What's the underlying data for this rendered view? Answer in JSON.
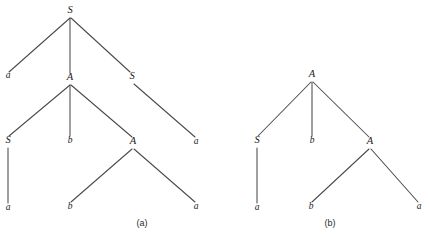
{
  "figure": {
    "background_color": "#ffffff",
    "edge_color": "#4a4a4a",
    "label_color": "#1a1a1a",
    "caption_color": "#2b2b2b",
    "width": 429,
    "height": 238
  },
  "trees": [
    {
      "id": "tree-a",
      "caption": "(a)",
      "caption_x": 142,
      "caption_y": 226,
      "root_symbol": "S",
      "nodes": [
        {
          "id": "a-root",
          "label": "S",
          "x": 70,
          "y": 13,
          "type": "nonterminal"
        },
        {
          "id": "a-n1",
          "label": "a",
          "x": 8,
          "y": 78,
          "type": "terminal"
        },
        {
          "id": "a-n2",
          "label": "A",
          "x": 70,
          "y": 80,
          "type": "nonterminal"
        },
        {
          "id": "a-n3",
          "label": "S",
          "x": 132,
          "y": 79,
          "type": "nonterminal"
        },
        {
          "id": "a-n4",
          "label": "S",
          "x": 8,
          "y": 143,
          "type": "nonterminal"
        },
        {
          "id": "a-n5",
          "label": "b",
          "x": 70,
          "y": 143,
          "type": "terminal"
        },
        {
          "id": "a-n6",
          "label": "A",
          "x": 133,
          "y": 144,
          "type": "nonterminal"
        },
        {
          "id": "a-n7",
          "label": "a",
          "x": 196,
          "y": 144,
          "type": "terminal"
        },
        {
          "id": "a-n8",
          "label": "a",
          "x": 8,
          "y": 210,
          "type": "terminal"
        },
        {
          "id": "a-n9",
          "label": "b",
          "x": 70,
          "y": 209,
          "type": "terminal"
        },
        {
          "id": "a-n10",
          "label": "a",
          "x": 196,
          "y": 209,
          "type": "terminal"
        }
      ],
      "edges": [
        {
          "from": "a-root",
          "to": "a-n1",
          "x1": 70,
          "y1": 18,
          "x2": 9,
          "y2": 72
        },
        {
          "from": "a-root",
          "to": "a-n2",
          "x1": 70,
          "y1": 18,
          "x2": 70,
          "y2": 73
        },
        {
          "from": "a-root",
          "to": "a-n3",
          "x1": 71,
          "y1": 18,
          "x2": 130,
          "y2": 72
        },
        {
          "from": "a-n2",
          "to": "a-n4",
          "x1": 70,
          "y1": 85,
          "x2": 9,
          "y2": 136
        },
        {
          "from": "a-n2",
          "to": "a-n5",
          "x1": 70,
          "y1": 85,
          "x2": 70,
          "y2": 136
        },
        {
          "from": "a-n2",
          "to": "a-n6",
          "x1": 71,
          "y1": 85,
          "x2": 132,
          "y2": 137
        },
        {
          "from": "a-n3",
          "to": "a-n7",
          "x1": 134,
          "y1": 84,
          "x2": 195,
          "y2": 137
        },
        {
          "from": "a-n4",
          "to": "a-n8",
          "x1": 8,
          "y1": 148,
          "x2": 8,
          "y2": 203
        },
        {
          "from": "a-n6",
          "to": "a-n9",
          "x1": 132,
          "y1": 149,
          "x2": 71,
          "y2": 202
        },
        {
          "from": "a-n6",
          "to": "a-n10",
          "x1": 134,
          "y1": 149,
          "x2": 195,
          "y2": 202
        }
      ]
    },
    {
      "id": "tree-b",
      "caption": "(b)",
      "caption_x": 330,
      "caption_y": 226,
      "root_symbol": "A",
      "nodes": [
        {
          "id": "b-root",
          "label": "A",
          "x": 312,
          "y": 77,
          "type": "nonterminal"
        },
        {
          "id": "b-n1",
          "label": "S",
          "x": 257,
          "y": 143,
          "type": "nonterminal"
        },
        {
          "id": "b-n2",
          "label": "b",
          "x": 312,
          "y": 143,
          "type": "terminal"
        },
        {
          "id": "b-n3",
          "label": "A",
          "x": 370,
          "y": 144,
          "type": "nonterminal"
        },
        {
          "id": "b-n4",
          "label": "a",
          "x": 257,
          "y": 210,
          "type": "terminal"
        },
        {
          "id": "b-n5",
          "label": "b",
          "x": 311,
          "y": 209,
          "type": "terminal"
        },
        {
          "id": "b-n6",
          "label": "a",
          "x": 419,
          "y": 209,
          "type": "terminal"
        }
      ],
      "edges": [
        {
          "from": "b-root",
          "to": "b-n1",
          "x1": 311,
          "y1": 82,
          "x2": 258,
          "y2": 136
        },
        {
          "from": "b-root",
          "to": "b-n2",
          "x1": 312,
          "y1": 82,
          "x2": 312,
          "y2": 136
        },
        {
          "from": "b-root",
          "to": "b-n3",
          "x1": 313,
          "y1": 82,
          "x2": 369,
          "y2": 137
        },
        {
          "from": "b-n1",
          "to": "b-n4",
          "x1": 257,
          "y1": 148,
          "x2": 257,
          "y2": 203
        },
        {
          "from": "b-n3",
          "to": "b-n5",
          "x1": 369,
          "y1": 149,
          "x2": 312,
          "y2": 202
        },
        {
          "from": "b-n3",
          "to": "b-n6",
          "x1": 371,
          "y1": 149,
          "x2": 418,
          "y2": 202
        }
      ]
    }
  ]
}
